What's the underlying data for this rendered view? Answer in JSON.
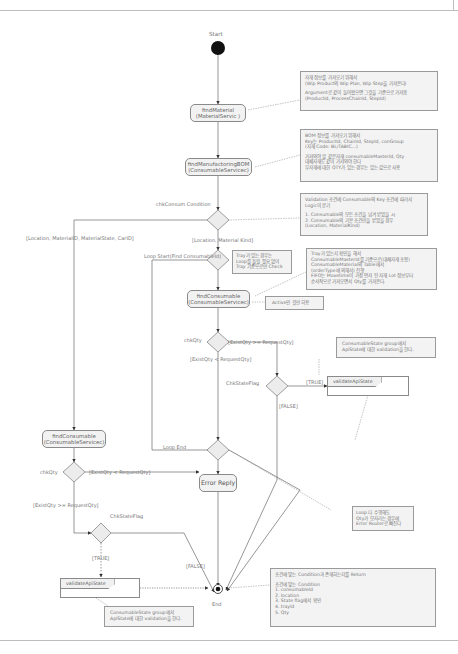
{
  "diagram": {
    "type": "uml-activity",
    "start_label": "Start",
    "end_label": "End"
  },
  "actions": {
    "find_material": [
      "findMaterial",
      "(MaterialServic )"
    ],
    "find_manufacturing_bom": [
      "findManufactoringBOM",
      "(ConsumableServicec)"
    ],
    "find_consumable_loop": [
      "findConsumable",
      "(ConsumableServicec)"
    ],
    "find_consumable_left": [
      "findConsumable",
      "(ConsumableServicec)"
    ],
    "error_reply": "Error Reply",
    "validate_api_state_right": "validateApiState",
    "validate_api_state_left": "validateApiState"
  },
  "labels": {
    "chk_consum_condition": "chkConsum Condition",
    "guard_left": "[Location, MaterialID, MaterialState, CarID]",
    "guard_down": "[Location, Material Kind]",
    "loop_start": "Loop Start(Find Consumableld)",
    "chk_qty_loop": "chkQty",
    "guard_exist_ge": "[ExistQty >= RequestQty]",
    "guard_exist_lt": "[ExistQty < RequestQty]",
    "chk_state_flag_loop": "ChkStateFlag",
    "true_right": "[TRUE]",
    "false_right": "[FALSE]",
    "loop_end": "Loop End",
    "chk_qty_left": "chkQty",
    "guard_left_lt": "[ExistQty < RequestQty]",
    "guard_left_ge": "[ExistQty >= RequestQty]",
    "chk_state_flag_left": "ChkStateFlag",
    "true_left": "[TRUE]",
    "false_left": "[FALSE]"
  },
  "notes": {
    "material": [
      "자재 정보를 가져오기 위해서",
      "(Wip Product의 Wip Plan, Wip Step을 가져온다)",
      "",
      "Argument로 같이 들어왔으면 그것을 기준으로 가져옴",
      "(ProductId, ProcessChainId, StepId)"
    ],
    "bom": [
      "BOM 정보를 가져오기 위해서",
      "Key는 ProductId, ChainId, StepId, conGroup",
      "(자재 Code: BL/TABIC...)",
      "",
      "가져와야 할 같은자재 consumableMasterId, Qty",
      "대체자재도 같이 가져와야 한다",
      "부자재에 대한 QTY가 있는 경우는 있는 값으로 사용"
    ],
    "validation": [
      "Validation 조건에 Consumable의 Key 조건에 따라서",
      "Logic이 분기",
      "",
      "1. Consumable의 모든 조건을 넘겨 받았을 시",
      "2. Consumable의 기본 조건만을 받았을 경우",
      "(Location, MaterialKind)"
    ],
    "tray": [
      "Tray가 있는 경우는",
      "Loop를 돌릴 필요 없이",
      "Tray 기준으로만 Check"
    ],
    "tray_check": [
      "Tray가 있는지 확인을 해서",
      "ConsumableMasterId를 기준으로(대체자재 포함)",
      "ConsumableMaterial의 Table에서",
      "(orderType에 의해서) 진행",
      "FIFO는 Movetime이 가장 먼저 된 자재 Lot 정보부터",
      "순서적으로 가져오면서 Qty를 가져온다."
    ],
    "active": [
      "Active인 것만 허용"
    ],
    "state_right": [
      "ConsumableState group에서",
      "ApiState에 대한 validation을 한다."
    ],
    "loop_error": [
      "Loop 다 수행해도",
      "Qty가 모자라는 경우에",
      "Error Router로 빠진다"
    ],
    "state_left": [
      "ConsumableState group에서",
      "ApiState에 대한 validation을 한다."
    ],
    "return": [
      "조건에 맞는 Condition과 존재하는지를 Return",
      "",
      "조건에 맞는 Condition",
      "1. consumableld",
      "2. location",
      "3. State flag에서 확인",
      "4. trayld",
      "5. Qty"
    ]
  },
  "colors": {
    "line": "#666666",
    "action_fill": "#f2f2f2",
    "note_fill": "#f3f3f3",
    "decision_fill": "#ececec",
    "node": "#111111"
  }
}
